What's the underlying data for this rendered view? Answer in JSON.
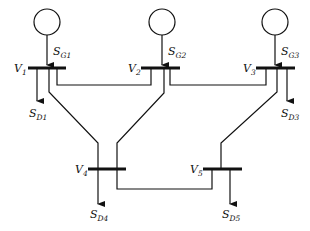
{
  "diagram": {
    "type": "five-bus power system one-line diagram",
    "buses": [
      {
        "id": "1",
        "voltage_label": "V",
        "voltage_sub": "1",
        "gen_label": "S",
        "gen_sub": "G1",
        "load_label": "S",
        "load_sub": "D1"
      },
      {
        "id": "2",
        "voltage_label": "V",
        "voltage_sub": "2",
        "gen_label": "S",
        "gen_sub": "G2"
      },
      {
        "id": "3",
        "voltage_label": "V",
        "voltage_sub": "3",
        "gen_label": "S",
        "gen_sub": "G3",
        "load_label": "S",
        "load_sub": "D3"
      },
      {
        "id": "4",
        "voltage_label": "V",
        "voltage_sub": "4",
        "load_label": "S",
        "load_sub": "D4"
      },
      {
        "id": "5",
        "voltage_label": "V",
        "voltage_sub": "5",
        "load_label": "S",
        "load_sub": "D5"
      }
    ],
    "lines": [
      {
        "from": "1",
        "to": "2"
      },
      {
        "from": "2",
        "to": "3"
      },
      {
        "from": "1",
        "to": "4"
      },
      {
        "from": "2",
        "to": "4"
      },
      {
        "from": "3",
        "to": "5"
      },
      {
        "from": "4",
        "to": "5"
      }
    ],
    "generators": [
      {
        "bus": "1",
        "icon": "generator-circle-icon"
      },
      {
        "bus": "2",
        "icon": "generator-circle-icon"
      },
      {
        "bus": "3",
        "icon": "generator-circle-icon"
      }
    ]
  }
}
